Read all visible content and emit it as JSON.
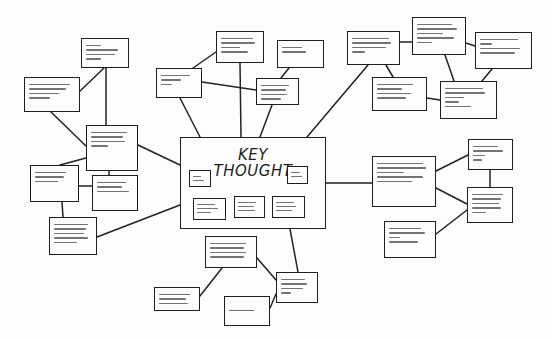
{
  "diagram": {
    "type": "mind-map",
    "style": "hand-drawn sketch",
    "central": {
      "title_line1": "KEY",
      "title_line2": "THOUGHT",
      "inner_notes": [
        {
          "id": "c1",
          "lines": 3
        },
        {
          "id": "c2",
          "lines": 3
        },
        {
          "id": "c3",
          "lines": 3
        },
        {
          "id": "c4",
          "lines": 3
        },
        {
          "id": "c5",
          "lines": 3
        }
      ]
    },
    "nodes": [
      {
        "id": "A",
        "x": 81,
        "y": 38,
        "w": 48,
        "h": 30,
        "lines": 4
      },
      {
        "id": "B",
        "x": 24,
        "y": 77,
        "w": 56,
        "h": 35,
        "lines": 4
      },
      {
        "id": "C",
        "x": 86,
        "y": 125,
        "w": 52,
        "h": 46,
        "lines": 4
      },
      {
        "id": "D",
        "x": 30,
        "y": 165,
        "w": 49,
        "h": 37,
        "lines": 3
      },
      {
        "id": "E",
        "x": 92,
        "y": 175,
        "w": 46,
        "h": 36,
        "lines": 3
      },
      {
        "id": "F",
        "x": 49,
        "y": 217,
        "w": 48,
        "h": 38,
        "lines": 5
      },
      {
        "id": "G",
        "x": 156,
        "y": 68,
        "w": 46,
        "h": 30,
        "lines": 3
      },
      {
        "id": "H",
        "x": 216,
        "y": 31,
        "w": 48,
        "h": 32,
        "lines": 4
      },
      {
        "id": "I",
        "x": 277,
        "y": 40,
        "w": 47,
        "h": 28,
        "lines": 2
      },
      {
        "id": "J",
        "x": 256,
        "y": 78,
        "w": 43,
        "h": 27,
        "lines": 4
      },
      {
        "id": "K",
        "x": 347,
        "y": 31,
        "w": 53,
        "h": 34,
        "lines": 4
      },
      {
        "id": "L",
        "x": 412,
        "y": 17,
        "w": 54,
        "h": 38,
        "lines": 5
      },
      {
        "id": "M",
        "x": 475,
        "y": 32,
        "w": 57,
        "h": 37,
        "lines": 4
      },
      {
        "id": "N",
        "x": 372,
        "y": 77,
        "w": 55,
        "h": 34,
        "lines": 4
      },
      {
        "id": "O",
        "x": 440,
        "y": 81,
        "w": 57,
        "h": 38,
        "lines": 5
      },
      {
        "id": "P",
        "x": 372,
        "y": 156,
        "w": 64,
        "h": 51,
        "lines": 5
      },
      {
        "id": "Q",
        "x": 468,
        "y": 139,
        "w": 45,
        "h": 31,
        "lines": 4
      },
      {
        "id": "R",
        "x": 467,
        "y": 187,
        "w": 46,
        "h": 36,
        "lines": 5
      },
      {
        "id": "S",
        "x": 384,
        "y": 221,
        "w": 52,
        "h": 37,
        "lines": 4
      },
      {
        "id": "T",
        "x": 205,
        "y": 236,
        "w": 52,
        "h": 32,
        "lines": 4
      },
      {
        "id": "U",
        "x": 154,
        "y": 287,
        "w": 46,
        "h": 24,
        "lines": 4
      },
      {
        "id": "V",
        "x": 224,
        "y": 296,
        "w": 46,
        "h": 30,
        "lines": 1
      },
      {
        "id": "W",
        "x": 276,
        "y": 272,
        "w": 42,
        "h": 31,
        "lines": 4
      }
    ],
    "edges": [
      [
        "central",
        "C"
      ],
      [
        "central",
        "F"
      ],
      [
        "central",
        "G"
      ],
      [
        "central",
        "H"
      ],
      [
        "central",
        "J"
      ],
      [
        "central",
        "K"
      ],
      [
        "central",
        "P"
      ],
      [
        "central",
        "W"
      ],
      [
        "C",
        "B"
      ],
      [
        "C",
        "D"
      ],
      [
        "C",
        "E"
      ],
      [
        "C",
        "A"
      ],
      [
        "A",
        "B"
      ],
      [
        "D",
        "F"
      ],
      [
        "G",
        "J"
      ],
      [
        "I",
        "J"
      ],
      [
        "K",
        "L"
      ],
      [
        "K",
        "N"
      ],
      [
        "L",
        "M"
      ],
      [
        "L",
        "O"
      ],
      [
        "M",
        "O"
      ],
      [
        "N",
        "O"
      ],
      [
        "P",
        "Q"
      ],
      [
        "P",
        "R"
      ],
      [
        "Q",
        "R"
      ],
      [
        "R",
        "S"
      ],
      [
        "W",
        "T"
      ],
      [
        "W",
        "V"
      ],
      [
        "T",
        "U"
      ]
    ],
    "colors": {
      "ink": "#1e1e1e",
      "paper": "#fdfdfd"
    }
  }
}
